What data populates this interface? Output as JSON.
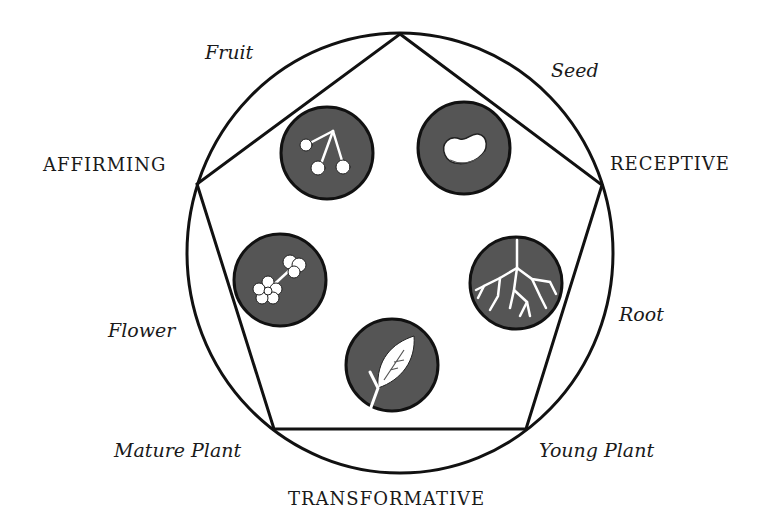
{
  "diagram": {
    "colors": {
      "line": "#111111",
      "medallion_fill": "#555555",
      "icon_fill": "#ffffff",
      "text": "#1a1a1a"
    },
    "forces": {
      "receptive": "RECEPTIVE",
      "affirming": "AFFIRMING",
      "transformative": "TRANSFORMATIVE"
    },
    "stages": [
      {
        "id": "seed",
        "label": "Seed",
        "icon": "bean-seed-icon"
      },
      {
        "id": "root",
        "label": "Root",
        "icon": "roots-icon"
      },
      {
        "id": "young-plant",
        "label": "Young Plant",
        "icon": "leaf-sprout-icon"
      },
      {
        "id": "mature-plant",
        "label": "Mature Plant",
        "icon": null
      },
      {
        "id": "flower",
        "label": "Flower",
        "icon": "blossom-icon"
      },
      {
        "id": "fruit",
        "label": "Fruit",
        "icon": "cherries-icon"
      }
    ]
  }
}
